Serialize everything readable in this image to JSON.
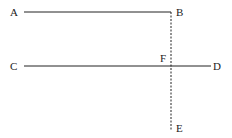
{
  "diagram": {
    "colors": {
      "line": "#222222",
      "background": "#ffffff"
    },
    "points": {
      "A": {
        "label": "A",
        "x": 24,
        "y": 12
      },
      "B": {
        "label": "B",
        "x": 171,
        "y": 12
      },
      "C": {
        "label": "C",
        "x": 24,
        "y": 66
      },
      "D": {
        "label": "D",
        "x": 211,
        "y": 66
      },
      "E": {
        "label": "E",
        "x": 171,
        "y": 131
      },
      "F": {
        "label": "F",
        "x": 171,
        "y": 66
      }
    },
    "segments": [
      {
        "name": "AB",
        "from": "A",
        "to": "B",
        "style": "solid"
      },
      {
        "name": "CD",
        "from": "C",
        "to": "D",
        "style": "solid"
      },
      {
        "name": "BE",
        "from": "B",
        "to": "E",
        "style": "dashed"
      }
    ]
  }
}
